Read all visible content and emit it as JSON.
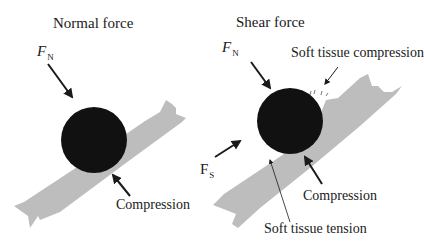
{
  "panels": [
    {
      "title": "Normal force",
      "force_symbol": "F",
      "force_subscript": "N",
      "labels": {
        "compression": "Compression"
      }
    },
    {
      "title": "Shear force",
      "force_symbol": "F",
      "force_subscript": "N",
      "shear_symbol": "F",
      "shear_subscript": "S",
      "labels": {
        "soft_tissue_compression": "Soft tissue compression",
        "compression": "Compression",
        "soft_tissue_tension": "Soft tissue tension"
      }
    }
  ],
  "colors": {
    "ball": "#111111",
    "tissue": "#bdbdbd",
    "arrow": "#1a1a1a",
    "text": "#1a1a1a"
  }
}
